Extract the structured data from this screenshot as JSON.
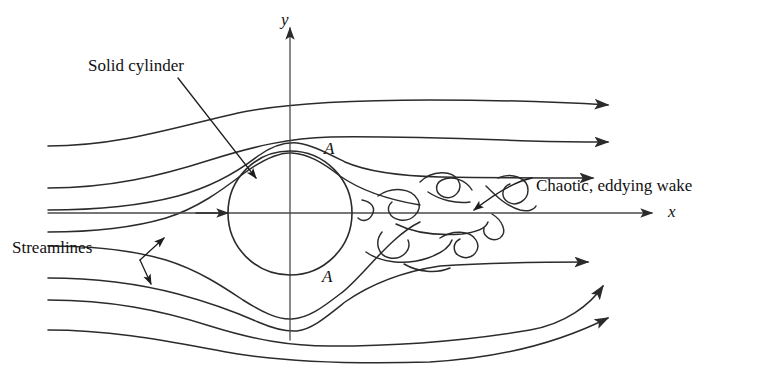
{
  "figure": {
    "kind": "fluid-flow-diagram",
    "background_color": "#ffffff",
    "line_color": "#2b2b2b",
    "text_color": "#111111"
  },
  "axes": {
    "x_label": "x",
    "y_label": "y",
    "origin": {
      "x": 290,
      "y": 213
    },
    "x_axis": {
      "start_x": 48,
      "end_x": 660,
      "y": 213,
      "arrow": "right"
    },
    "y_axis": {
      "x": 290,
      "start_y": 340,
      "end_y": 20,
      "arrow": "up"
    }
  },
  "cylinder": {
    "label": "Solid cylinder",
    "center": {
      "x": 290,
      "y": 213
    },
    "radius": 62,
    "leader": {
      "from_x": 178,
      "from_y": 78,
      "to_x": 258,
      "to_y": 180
    }
  },
  "separation_points": {
    "label": "A",
    "upper": {
      "x": 330,
      "y": 150
    },
    "lower": {
      "x": 328,
      "y": 278
    }
  },
  "wake": {
    "label": "Chaotic, eddying wake",
    "text_position": {
      "x": 535,
      "y": 176
    },
    "leader": {
      "from_x": 530,
      "from_y": 180,
      "to_x": 470,
      "to_y": 212
    },
    "extent": {
      "x_min": 360,
      "x_max": 535,
      "y_min": 172,
      "y_max": 268
    }
  },
  "streamlines": {
    "label": "Streamlines",
    "text_position": {
      "x": 14,
      "y": 249
    },
    "caliper": {
      "elbow": {
        "x": 140,
        "y": 260
      },
      "arrow_upper": {
        "x": 166,
        "y": 236
      },
      "arrow_lower": {
        "x": 153,
        "y": 286
      }
    },
    "count": 8,
    "inlet_x": 48,
    "lines": [
      {
        "name": "outer-upper-1",
        "inlet_y": 146,
        "outlet_y": 105,
        "outlet_x": 620,
        "arrow": true
      },
      {
        "name": "outer-upper-2",
        "inlet_y": 188,
        "outlet_y": 142,
        "outlet_x": 620,
        "arrow": true
      },
      {
        "name": "inner-upper",
        "inlet_y": 210,
        "outlet_y": 178,
        "outlet_x": 605,
        "arrow": true
      },
      {
        "name": "separating-upper",
        "inlet_y": 232,
        "outlet_y": 205,
        "outlet_x": 430,
        "arrow": false
      },
      {
        "name": "stagnation-axis",
        "inlet_y": 213,
        "outlet_y": 213,
        "outlet_x": 660,
        "arrow": true
      },
      {
        "name": "separating-lower",
        "inlet_y": 246,
        "outlet_y": 222,
        "outlet_x": 430,
        "arrow": false
      },
      {
        "name": "inner-lower",
        "inlet_y": 278,
        "outlet_y": 262,
        "outlet_x": 600,
        "arrow": true
      },
      {
        "name": "outer-lower-2",
        "inlet_y": 300,
        "outlet_y": 283,
        "outlet_x": 615,
        "arrow": true
      },
      {
        "name": "outer-lower-1",
        "inlet_y": 330,
        "outlet_y": 318,
        "outlet_x": 620,
        "arrow": true
      }
    ]
  }
}
